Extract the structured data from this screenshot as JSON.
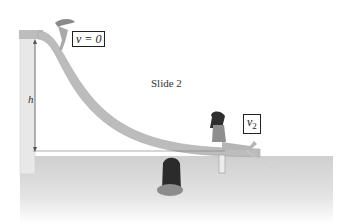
{
  "diagram": {
    "title": "Slide 2",
    "labels": {
      "top_velocity": "v = 0",
      "bottom_velocity": "v",
      "bottom_velocity_subscript": "2",
      "height": "h"
    },
    "colors": {
      "slide": "#b9b9b9",
      "tower": "#e6e6e6",
      "water": "#d2d2d2",
      "line": "#555555"
    }
  }
}
